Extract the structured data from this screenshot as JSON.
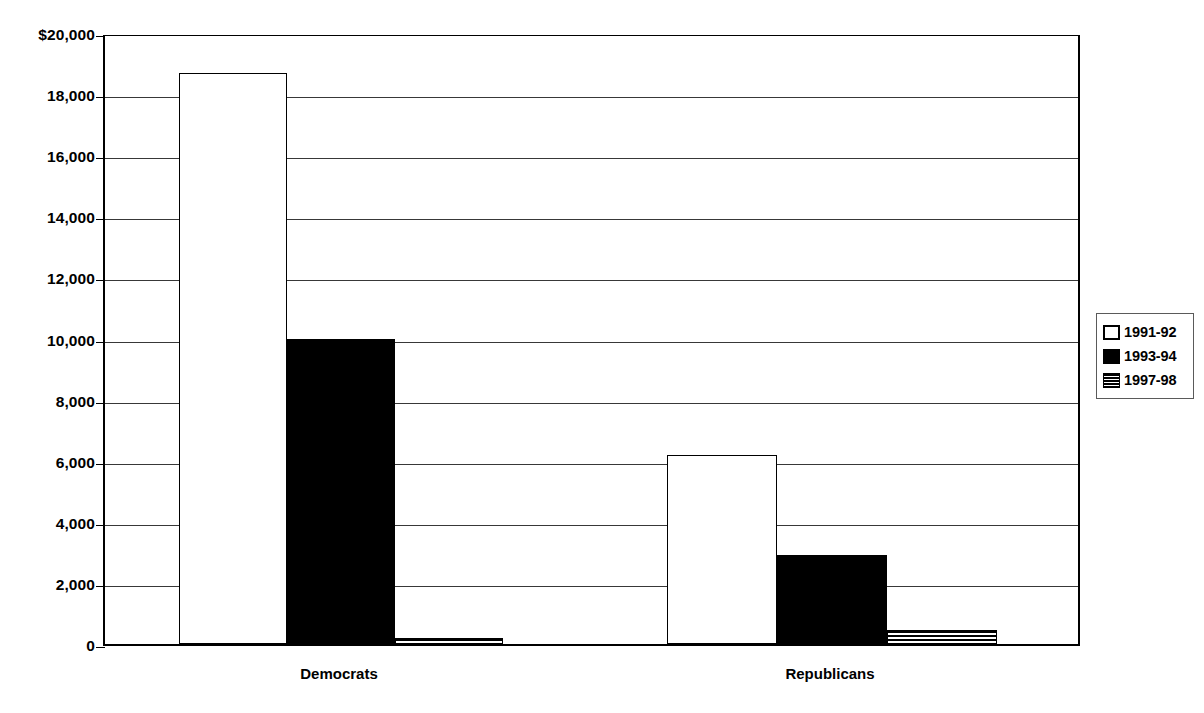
{
  "chart_data": {
    "type": "bar",
    "title": "",
    "subtitle": "",
    "xlabel": "",
    "ylabel": "",
    "categories": [
      "Democrats",
      "Republicans"
    ],
    "series": [
      {
        "name": "1991-92",
        "values": [
          18700,
          6200
        ],
        "fill": "white"
      },
      {
        "name": "1993-94",
        "values": [
          10000,
          2900
        ],
        "fill": "black"
      },
      {
        "name": "1997-98",
        "values": [
          200,
          450
        ],
        "fill": "striped"
      }
    ],
    "ylim": [
      0,
      20000
    ],
    "ytick_values": [
      0,
      2000,
      4000,
      6000,
      8000,
      10000,
      12000,
      14000,
      16000,
      18000,
      20000
    ],
    "ytick_labels": [
      "0",
      "2,000",
      "4,000",
      "6,000",
      "8,000",
      "10,000",
      "12,000",
      "14,000",
      "16,000",
      "18,000",
      "$20,000"
    ],
    "grid": true,
    "legend_position": "right",
    "colors": {
      "white": "#ffffff",
      "black": "#000000",
      "axis": "#000000",
      "grid": "#000000"
    }
  }
}
